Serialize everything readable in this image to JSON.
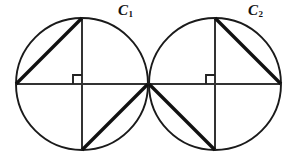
{
  "figure": {
    "domain": "Diagram",
    "width": 295,
    "height": 165,
    "background_color": "#ffffff",
    "stroke_color": "#1a1a1a",
    "thick_stroke_color": "#111111"
  },
  "labels": {
    "circle1": {
      "letter": "C",
      "subscript": "1"
    },
    "circle2": {
      "letter": "C",
      "subscript": "2"
    }
  },
  "geometry": {
    "circle1": {
      "name": "C1",
      "center": {
        "x": 82,
        "y": 84
      },
      "radius": 66,
      "points": {
        "left": {
          "x": 16,
          "y": 84
        },
        "right": {
          "x": 148,
          "y": 84
        },
        "top": {
          "x": 82,
          "y": 18
        },
        "bottom": {
          "x": 82,
          "y": 150
        }
      },
      "diameters": [
        {
          "name": "horizontal-diameter",
          "x1": 16,
          "y1": 84,
          "x2": 148,
          "y2": 84
        },
        {
          "name": "vertical-diameter",
          "x1": 82,
          "y1": 18,
          "x2": 82,
          "y2": 150
        }
      ],
      "chords": [
        {
          "name": "chord-upper-left",
          "x1": 16,
          "y1": 84,
          "x2": 82,
          "y2": 18
        },
        {
          "name": "chord-lower-right",
          "x1": 82,
          "y1": 150,
          "x2": 148,
          "y2": 84
        }
      ],
      "right_angle_mark": {
        "x": 73,
        "y": 75,
        "size": 9,
        "quadrant": "upper-left"
      }
    },
    "circle2": {
      "name": "C2",
      "center": {
        "x": 215,
        "y": 84
      },
      "radius": 66,
      "points": {
        "left": {
          "x": 149,
          "y": 84
        },
        "right": {
          "x": 281,
          "y": 84
        },
        "top": {
          "x": 215,
          "y": 18
        },
        "bottom": {
          "x": 215,
          "y": 150
        }
      },
      "diameters": [
        {
          "name": "horizontal-diameter",
          "x1": 149,
          "y1": 84,
          "x2": 281,
          "y2": 84
        },
        {
          "name": "vertical-diameter",
          "x1": 215,
          "y1": 18,
          "x2": 215,
          "y2": 150
        }
      ],
      "chords": [
        {
          "name": "chord-upper-right",
          "x1": 215,
          "y1": 18,
          "x2": 281,
          "y2": 84
        },
        {
          "name": "chord-lower-left",
          "x1": 149,
          "y1": 84,
          "x2": 215,
          "y2": 150
        }
      ],
      "right_angle_mark": {
        "x": 206,
        "y": 75,
        "size": 9,
        "quadrant": "upper-left"
      }
    },
    "tangency_point": {
      "x": 148.5,
      "y": 84
    }
  }
}
